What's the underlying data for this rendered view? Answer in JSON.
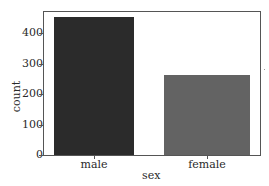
{
  "chart_data": {
    "type": "bar",
    "title": "",
    "xlabel": "sex",
    "ylabel": "count",
    "categories": [
      "male",
      "female"
    ],
    "values": [
      453,
      261
    ],
    "colors": [
      "#2b2b2b",
      "#636363"
    ],
    "ylim": [
      0,
      475
    ],
    "yticks": [
      0,
      100,
      200,
      300,
      400
    ],
    "ytick_labels": [
      "0",
      "100",
      "200",
      "300",
      "400"
    ],
    "grid": false,
    "legend": null
  }
}
